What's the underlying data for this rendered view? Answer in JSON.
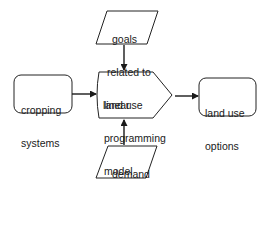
{
  "diagram": {
    "type": "flowchart",
    "nodes": [
      {
        "id": "goals",
        "shape": "parallelogram",
        "label_lines": [
          "goals",
          "related to",
          "land use"
        ]
      },
      {
        "id": "cropping",
        "shape": "rounded-rect",
        "label_lines": [
          "cropping",
          "systems"
        ]
      },
      {
        "id": "lp_model",
        "shape": "pentagon-arrow",
        "label_lines": [
          "linear",
          "programming",
          "model"
        ]
      },
      {
        "id": "land_use_options",
        "shape": "rounded-rect",
        "label_lines": [
          "land use",
          "options"
        ]
      },
      {
        "id": "demand",
        "shape": "parallelogram",
        "label_lines": [
          "demand",
          "for",
          "produce"
        ]
      }
    ],
    "edges": [
      {
        "from": "goals",
        "to": "lp_model"
      },
      {
        "from": "cropping",
        "to": "lp_model"
      },
      {
        "from": "demand",
        "to": "lp_model"
      },
      {
        "from": "lp_model",
        "to": "land_use_options"
      }
    ]
  },
  "labels": {
    "goals": {
      "l1": "goals",
      "l2": "related to",
      "l3": "land use"
    },
    "cropping": {
      "l1": "cropping",
      "l2": "systems"
    },
    "lp_model": {
      "l1": "linear",
      "l2": "programming",
      "l3": "model"
    },
    "land_use_options": {
      "l1": "land use",
      "l2": "options"
    },
    "demand": {
      "l1": "demand",
      "l2": "for",
      "l3": "produce"
    }
  },
  "colors": {
    "stroke": "#222222",
    "fill": "#ffffff",
    "text": "#1a1a1a"
  }
}
